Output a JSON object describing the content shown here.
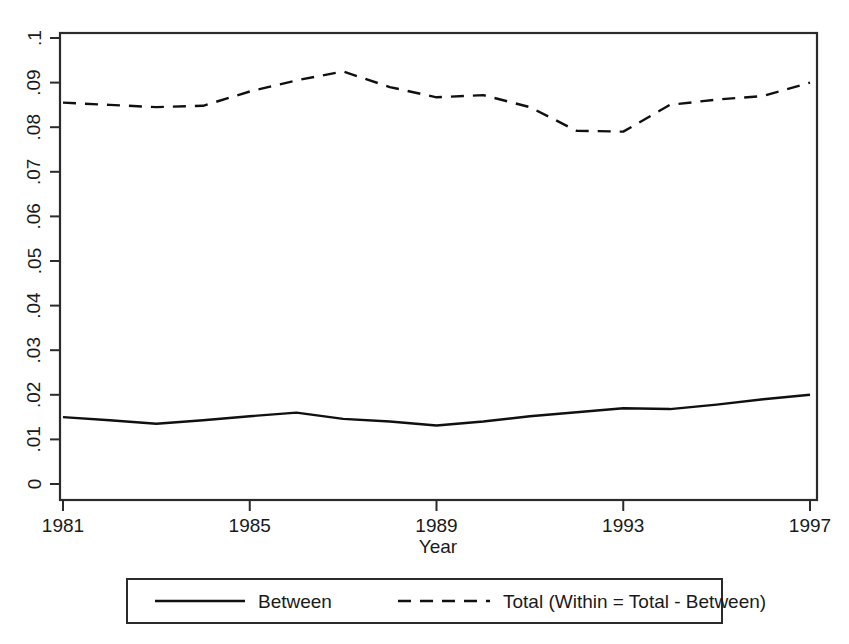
{
  "chart_data": {
    "type": "line",
    "title": "",
    "subtitle": "",
    "xlabel": "Year",
    "ylabel": "",
    "xlim": [
      1981,
      1997
    ],
    "ylim": [
      0,
      0.1
    ],
    "grid": false,
    "legend_position": "bottom",
    "x": [
      1981,
      1982,
      1983,
      1984,
      1985,
      1986,
      1987,
      1988,
      1989,
      1990,
      1991,
      1992,
      1993,
      1994,
      1995,
      1996,
      1997
    ],
    "xticks": [
      "1981",
      "1985",
      "1989",
      "1993",
      "1997"
    ],
    "xtick_values": [
      1981,
      1985,
      1989,
      1993,
      1997
    ],
    "yticks": [
      "0",
      ".01",
      ".02",
      ".03",
      ".04",
      ".05",
      ".06",
      ".07",
      ".08",
      ".09",
      ".1"
    ],
    "ytick_values": [
      0,
      0.01,
      0.02,
      0.03,
      0.04,
      0.05,
      0.06,
      0.07,
      0.08,
      0.09,
      0.1
    ],
    "series": [
      {
        "name": "Between",
        "style": "solid",
        "values": [
          0.015,
          0.0143,
          0.0135,
          0.0143,
          0.0152,
          0.016,
          0.0146,
          0.014,
          0.0131,
          0.014,
          0.0152,
          0.0161,
          0.017,
          0.0168,
          0.0178,
          0.019,
          0.02
        ]
      },
      {
        "name": "Total (Within = Total - Between)",
        "style": "dashed",
        "values": [
          0.0855,
          0.085,
          0.0845,
          0.0848,
          0.088,
          0.0905,
          0.0925,
          0.089,
          0.0867,
          0.0872,
          0.0845,
          0.0792,
          0.079,
          0.085,
          0.0862,
          0.087,
          0.09
        ]
      }
    ]
  },
  "legend": {
    "entries": [
      {
        "label": "Between",
        "style": "solid"
      },
      {
        "label": "Total (Within = Total - Between)",
        "style": "dashed"
      }
    ]
  },
  "axes": {
    "x_title": "Year",
    "y_title": ""
  }
}
